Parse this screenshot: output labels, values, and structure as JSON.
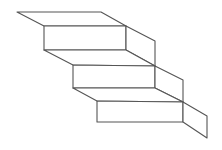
{
  "diagram": {
    "type": "isometric-line-drawing",
    "step_count": 3,
    "colors": {
      "background": "#ffffff",
      "stroke": "#555555",
      "fill": "#ffffff"
    },
    "stroke_width": 1.1,
    "steps": [
      {
        "name": "step-1",
        "tread": [
          [
            17,
            12
          ],
          [
            101,
            12
          ],
          [
            126,
            26
          ],
          [
            44,
            26
          ]
        ],
        "riser": [
          [
            44,
            26
          ],
          [
            126,
            26
          ],
          [
            126,
            50
          ],
          [
            44,
            50
          ]
        ],
        "side": [
          [
            126,
            26
          ],
          [
            155,
            41
          ],
          [
            155,
            66
          ],
          [
            126,
            50
          ]
        ]
      },
      {
        "name": "step-2",
        "tread": [
          [
            44,
            50
          ],
          [
            126,
            50
          ],
          [
            155,
            66
          ],
          [
            73,
            65
          ]
        ],
        "riser": [
          [
            73,
            65
          ],
          [
            155,
            66
          ],
          [
            155,
            88
          ],
          [
            73,
            88
          ]
        ],
        "side": [
          [
            155,
            66
          ],
          [
            183,
            80
          ],
          [
            183,
            102
          ],
          [
            155,
            88
          ]
        ]
      },
      {
        "name": "step-3",
        "tread": [
          [
            73,
            88
          ],
          [
            155,
            88
          ],
          [
            183,
            102
          ],
          [
            97,
            101
          ]
        ],
        "riser": [
          [
            97,
            101
          ],
          [
            183,
            102
          ],
          [
            183,
            122
          ],
          [
            97,
            122
          ]
        ],
        "side": [
          [
            183,
            102
          ],
          [
            207,
            116
          ],
          [
            207,
            138
          ],
          [
            183,
            122
          ]
        ]
      }
    ]
  }
}
